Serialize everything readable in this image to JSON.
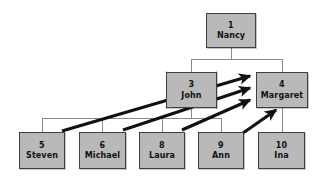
{
  "diagram": {
    "type": "family-tree",
    "colors": {
      "node_fill": "#b9b9b9",
      "node_border": "#404040",
      "thin_line": "#8a8a8a",
      "arrow": "#111111",
      "text": "#111111",
      "background": "#ffffff"
    },
    "nodes": [
      {
        "key": "n1",
        "id": "1",
        "name": "Nancy",
        "x": 206,
        "y": 13,
        "w": 50,
        "h": 35,
        "crossed": "false",
        "generation": "1"
      },
      {
        "key": "n3",
        "id": "3",
        "name": "John",
        "x": 166,
        "y": 72,
        "w": 51,
        "h": 36,
        "crossed": "true",
        "generation": "2"
      },
      {
        "key": "n4",
        "id": "4",
        "name": "Margaret",
        "x": 256,
        "y": 72,
        "w": 52,
        "h": 36,
        "crossed": "false",
        "generation": "2"
      },
      {
        "key": "n5",
        "id": "5",
        "name": "Steven",
        "x": 19,
        "y": 132,
        "w": 46,
        "h": 37,
        "crossed": "false",
        "generation": "3"
      },
      {
        "key": "n6",
        "id": "6",
        "name": "Michael",
        "x": 79,
        "y": 132,
        "w": 47,
        "h": 37,
        "crossed": "false",
        "generation": "3"
      },
      {
        "key": "n8",
        "id": "8",
        "name": "Laura",
        "x": 139,
        "y": 132,
        "w": 46,
        "h": 37,
        "crossed": "false",
        "generation": "3"
      },
      {
        "key": "n9",
        "id": "9",
        "name": "Ann",
        "x": 198,
        "y": 132,
        "w": 46,
        "h": 37,
        "crossed": "false",
        "generation": "3"
      },
      {
        "key": "n10",
        "id": "10",
        "name": "Ina",
        "x": 258,
        "y": 132,
        "w": 47,
        "h": 37,
        "crossed": "false",
        "generation": "3"
      }
    ],
    "thin_links": [
      {
        "from": "1",
        "to": "3"
      },
      {
        "from": "1",
        "to": "4"
      },
      {
        "from": "3",
        "to": "5"
      },
      {
        "from": "3",
        "to": "6"
      },
      {
        "from": "3",
        "to": "8"
      },
      {
        "from": "3",
        "to": "9"
      },
      {
        "from": "4",
        "to": "10"
      }
    ],
    "arrow_links": [
      {
        "from": "5",
        "to": "4"
      },
      {
        "from": "6",
        "to": "4"
      },
      {
        "from": "8",
        "to": "4"
      },
      {
        "from": "9",
        "to": "4"
      }
    ]
  }
}
